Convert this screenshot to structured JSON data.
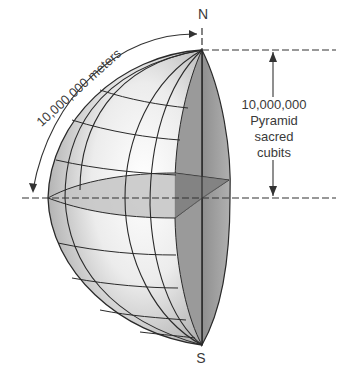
{
  "diagram": {
    "labels": {
      "north": "N",
      "south": "S",
      "arc_length": "10,000,000 meters",
      "radius_line1": "10,000,000",
      "radius_line2": "Pyramid",
      "radius_line3": "sacred",
      "radius_line4": "cubits"
    },
    "colors": {
      "line": "#2a2a2a",
      "shade_dark": "#8a8a8a",
      "shade_mid": "#b5b5b5",
      "shade_light": "#f2f2f2",
      "text": "#3a3a3a"
    }
  }
}
